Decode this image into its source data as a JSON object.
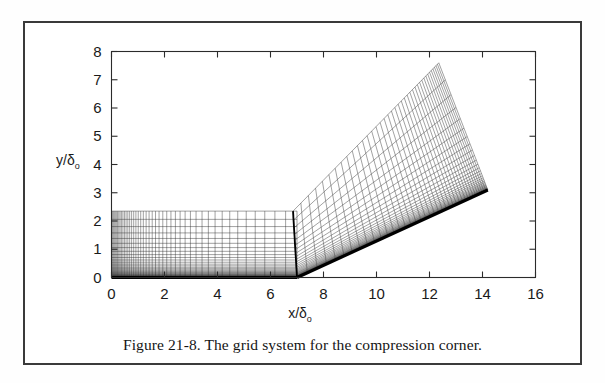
{
  "figure": {
    "caption": "Figure 21-8.  The grid system for the compression corner.",
    "caption_label": "Figure 21-8.",
    "caption_text": "The grid system for the compression corner."
  },
  "axes": {
    "x_label_main": "x/",
    "x_label_delta": "δ",
    "x_label_sub": "o",
    "y_label_main": "y/",
    "y_label_delta": "δ",
    "y_label_sub": "o",
    "x_ticks": [
      "0",
      "2",
      "4",
      "6",
      "8",
      "10",
      "12",
      "14",
      "16"
    ],
    "y_ticks": [
      "0",
      "1",
      "2",
      "3",
      "4",
      "5",
      "6",
      "7",
      "8"
    ],
    "x_range": [
      0,
      16
    ],
    "y_range": [
      0,
      8
    ],
    "frame_color": "#2b2b2b"
  },
  "chart_data": {
    "type": "line",
    "title": "Figure 21-8.  The grid system for the compression corner.",
    "xlabel": "x/δo",
    "ylabel": "y/δo",
    "xlim": [
      0,
      16
    ],
    "ylim": [
      0,
      8
    ],
    "xticks": [
      0,
      2,
      4,
      6,
      8,
      10,
      12,
      14,
      16
    ],
    "yticks": [
      0,
      1,
      2,
      3,
      4,
      5,
      6,
      7,
      8
    ],
    "grid": false,
    "legend": "none",
    "series": [
      {
        "name": "flat-plate-block",
        "x_start": 0.0,
        "x_end": 7.0,
        "wall_y": 0.0,
        "top_y_at_x0": 2.35,
        "top_y_at_corner": 2.35,
        "n_streamwise_lines": 46,
        "n_normal_lines": 40,
        "streamwise_clustering": "geometric toward the corner (x=7)",
        "normal_clustering": "strong geometric clustering toward the wall y=0"
      },
      {
        "name": "ramp-block",
        "corner_x": 7.0,
        "corner_y": 0.0,
        "wall_end_x": 14.2,
        "wall_end_y": 3.1,
        "ramp_angle_deg": 24,
        "top_inlet_x": 6.85,
        "top_inlet_y": 2.35,
        "top_outlet_x": 12.35,
        "top_outlet_y": 7.6,
        "n_streamwise_lines": 40,
        "n_normal_lines": 36,
        "normal_clustering": "strong geometric clustering toward the ramp wall"
      }
    ],
    "annotations": [
      {
        "text": "corner location",
        "x": 7.0,
        "y": 0.0
      }
    ]
  },
  "colors": {
    "grid_line": "#2e2e2e",
    "wall_line": "#000000",
    "background": "#ffffff",
    "border": "#3a3a3a"
  }
}
